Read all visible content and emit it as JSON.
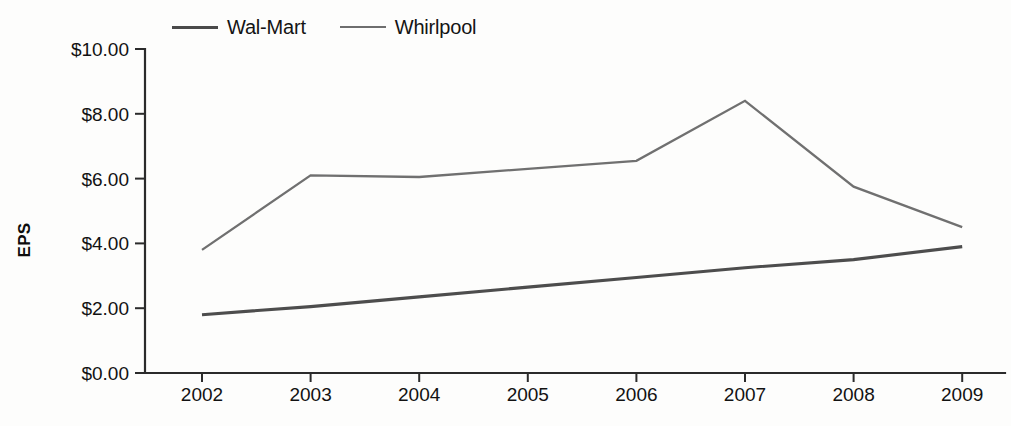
{
  "chart_data": {
    "type": "line",
    "title": "",
    "subtitle": "",
    "xlabel": "",
    "ylabel": "EPS",
    "x": [
      "2002",
      "2003",
      "2004",
      "2005",
      "2006",
      "2007",
      "2008",
      "2009"
    ],
    "categories": [
      "2002",
      "2003",
      "2004",
      "2005",
      "2006",
      "2007",
      "2008",
      "2009"
    ],
    "series": [
      {
        "name": "Wal-Mart",
        "color": "#4d4d4d",
        "values": [
          1.8,
          2.05,
          2.35,
          2.65,
          2.95,
          3.25,
          3.5,
          3.9
        ]
      },
      {
        "name": "Whirlpool",
        "color": "#707070",
        "values": [
          3.8,
          6.1,
          6.05,
          6.3,
          6.55,
          8.4,
          5.75,
          4.5
        ]
      }
    ],
    "ylim": [
      0,
      10
    ],
    "ytick_values": [
      0,
      2,
      4,
      6,
      8,
      10
    ],
    "ytick_labels": [
      "$0.00",
      "$2.00",
      "$4.00",
      "$6.00",
      "$8.00",
      "$10.00"
    ],
    "xtick_labels": [
      "2002",
      "2003",
      "2004",
      "2005",
      "2006",
      "2007",
      "2008",
      "2009"
    ],
    "grid": false,
    "legend_position": "top",
    "legend_entries": [
      "Wal-Mart",
      "Whirlpool"
    ]
  },
  "legend": {
    "entries": [
      {
        "label": "Wal-Mart",
        "color": "#4d4d4d"
      },
      {
        "label": "Whirlpool",
        "color": "#707070"
      }
    ]
  },
  "axes": {
    "y_title": "EPS"
  }
}
